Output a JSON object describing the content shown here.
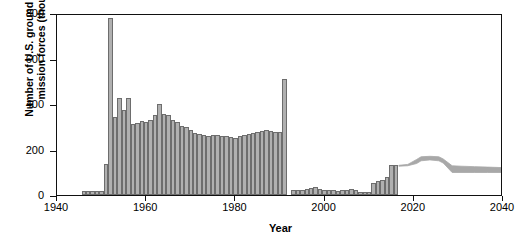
{
  "chart_data": {
    "type": "bar",
    "title": "",
    "xlabel": "Year",
    "ylabel": "Number of U.S. ground deterrence mission forces (thousands)",
    "ylabel_lines": [
      "Number of U.S. ground deterrence",
      "mission forces (thousands)"
    ],
    "xlim": [
      1940,
      2040
    ],
    "ylim": [
      0,
      800
    ],
    "ytick_values": [
      0,
      200,
      400,
      600,
      800
    ],
    "ytick_labels": [
      "0",
      "200",
      "400",
      "600",
      "800"
    ],
    "xtick_values": [
      1940,
      1960,
      1980,
      2000,
      2020,
      2040
    ],
    "xtick_labels": [
      "1940",
      "1960",
      "1980",
      "2000",
      "2020",
      "2040"
    ],
    "grid": false,
    "legend": "none",
    "bar_color": "#b0b0b0",
    "bar_edge_color": "#6d6d6d",
    "band_color": "#a8a8a8",
    "axis_color": "#111111",
    "units": "thousands",
    "x": [
      1946,
      1947,
      1948,
      1949,
      1950,
      1951,
      1952,
      1953,
      1954,
      1955,
      1956,
      1957,
      1958,
      1959,
      1960,
      1961,
      1962,
      1963,
      1964,
      1965,
      1966,
      1967,
      1968,
      1969,
      1970,
      1971,
      1972,
      1973,
      1974,
      1975,
      1976,
      1977,
      1978,
      1979,
      1980,
      1981,
      1982,
      1983,
      1984,
      1985,
      1986,
      1987,
      1988,
      1989,
      1990,
      1991,
      1992,
      1993,
      1994,
      1995,
      1996,
      1997,
      1998,
      1999,
      2000,
      2001,
      2002,
      2003,
      2004,
      2005,
      2006,
      2007,
      2008,
      2009,
      2010,
      2011,
      2012,
      2013,
      2014,
      2015,
      2016
    ],
    "values": [
      18,
      18,
      17,
      17,
      16,
      135,
      780,
      345,
      425,
      375,
      425,
      310,
      315,
      325,
      320,
      330,
      350,
      398,
      355,
      350,
      330,
      320,
      305,
      300,
      285,
      272,
      268,
      262,
      258,
      262,
      262,
      260,
      258,
      255,
      252,
      258,
      262,
      268,
      272,
      275,
      282,
      285,
      280,
      278,
      275,
      510,
      0,
      22,
      24,
      22,
      28,
      30,
      35,
      28,
      24,
      22,
      20,
      18,
      22,
      24,
      26,
      20,
      15,
      12,
      14,
      52,
      62,
      68,
      80,
      132,
      130
    ],
    "projection_band": {
      "label": "projected range",
      "x": [
        2017,
        2019,
        2021,
        2022,
        2024,
        2026,
        2027,
        2029,
        2031,
        2034,
        2037,
        2040
      ],
      "upper": [
        132,
        136,
        158,
        170,
        172,
        170,
        160,
        130,
        128,
        126,
        124,
        122
      ],
      "lower": [
        128,
        130,
        140,
        152,
        156,
        152,
        142,
        100,
        100,
        100,
        100,
        100
      ]
    },
    "annotations": [
      {
        "text": "peak 1952",
        "value": 780
      },
      {
        "text": "Gulf War spike 1991",
        "value": 510
      },
      {
        "text": "projection begins",
        "value": 2017
      }
    ]
  }
}
